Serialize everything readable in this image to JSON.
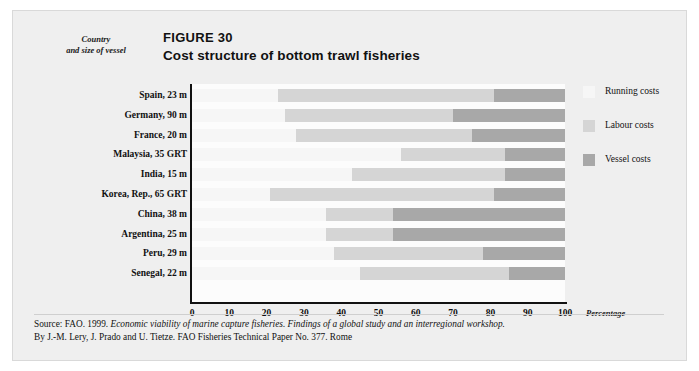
{
  "figure": {
    "number": "FIGURE 30",
    "title": "Cost structure of bottom trawl fisheries",
    "y_axis_caption_line1": "Country",
    "y_axis_caption_line2": "and size of vessel",
    "x_axis_title": "Percentage"
  },
  "legend": {
    "items": [
      {
        "label": "Running costs",
        "color": "#f6f6f6",
        "name": "running-costs"
      },
      {
        "label": "Labour costs",
        "color": "#d5d5d5",
        "name": "labour-costs"
      },
      {
        "label": "Vessel costs",
        "color": "#a8a8a8",
        "name": "vessel-costs"
      }
    ]
  },
  "source": {
    "line1_plain_a": "Source: FAO. 1999. ",
    "line1_italic": "Economic viability of marine capture fisheries. Findings of a global study and an interregional workshop.",
    "line2": "By J.-M. Lery, J. Prado and U. Tietze. FAO Fisheries Technical Paper No. 377. Rome"
  },
  "chart_data": {
    "type": "bar",
    "orientation": "horizontal",
    "stacked": true,
    "title": "Cost structure of bottom trawl fisheries",
    "xlabel": "Percentage",
    "ylabel": "Country and size of vessel",
    "xlim": [
      0,
      100
    ],
    "xticks": [
      0,
      10,
      20,
      30,
      40,
      50,
      60,
      70,
      80,
      90,
      100
    ],
    "grid": false,
    "legend_position": "right",
    "categories": [
      "Spain, 23 m",
      "Germany, 90 m",
      "France, 20 m",
      "Malaysia, 35 GRT",
      "India, 15 m",
      "Korea, Rep., 65 GRT",
      "China, 38 m",
      "Argentina, 25 m",
      "Peru, 29 m",
      "Senegal, 22 m"
    ],
    "series": [
      {
        "name": "Running costs",
        "color": "#f6f6f6",
        "values": [
          23,
          25,
          28,
          56,
          43,
          21,
          36,
          36,
          38,
          45
        ]
      },
      {
        "name": "Labour costs",
        "color": "#d5d5d5",
        "values": [
          58,
          45,
          47,
          28,
          41,
          60,
          18,
          18,
          40,
          40
        ]
      },
      {
        "name": "Vessel costs",
        "color": "#a8a8a8",
        "values": [
          19,
          30,
          25,
          16,
          16,
          19,
          46,
          46,
          22,
          15
        ]
      }
    ]
  }
}
